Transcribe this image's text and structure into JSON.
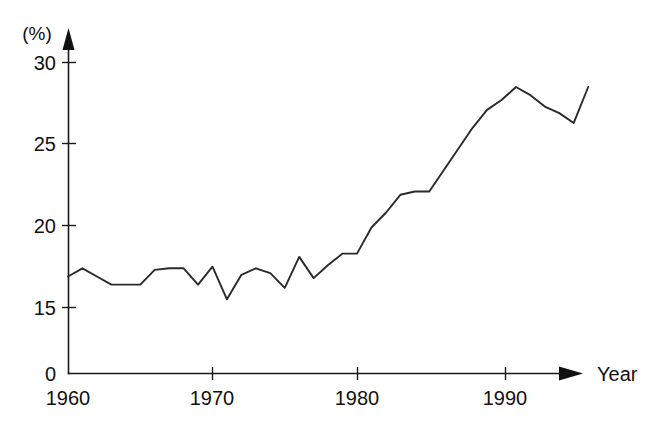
{
  "chart_data": {
    "type": "line",
    "title": "",
    "subtitle": "",
    "xlabel": "Year",
    "ylabel": "(%)",
    "unit_label": "(%)",
    "grid": false,
    "legend": null,
    "legend_position": "none",
    "axis_break": true,
    "axis_break_note": "Y axis jumps from 0 directly to 15",
    "xlim": [
      1959,
      1997
    ],
    "ylim": [
      0,
      31
    ],
    "y_ticks": [
      0,
      15,
      20,
      25,
      30
    ],
    "y_tick_labels": [
      "0",
      "15",
      "20",
      "25",
      "30"
    ],
    "x_ticks": [
      1960,
      1970,
      1980,
      1990
    ],
    "x_tick_labels": [
      "1960",
      "1970",
      "1980",
      "1990"
    ],
    "x": [
      1960,
      1961,
      1962,
      1963,
      1964,
      1965,
      1966,
      1967,
      1968,
      1969,
      1970,
      1971,
      1972,
      1973,
      1974,
      1975,
      1976,
      1977,
      1978,
      1979,
      1980,
      1981,
      1982,
      1983,
      1984,
      1985,
      1986,
      1987,
      1988,
      1989,
      1990,
      1991,
      1992,
      1993,
      1994,
      1995,
      1996
    ],
    "values": [
      16.9,
      17.4,
      16.9,
      16.4,
      16.4,
      16.4,
      17.3,
      17.4,
      17.4,
      16.4,
      17.5,
      15.5,
      17.0,
      17.4,
      17.1,
      16.2,
      18.1,
      16.8,
      17.6,
      18.3,
      18.3,
      19.9,
      20.8,
      21.9,
      22.1,
      22.1,
      23.4,
      24.7,
      26.0,
      27.1,
      27.7,
      28.5,
      28.0,
      27.3,
      26.9,
      26.3,
      28.5
    ],
    "series": [
      {
        "name": "percentage",
        "values": [
          16.9,
          17.4,
          16.9,
          16.4,
          16.4,
          16.4,
          17.3,
          17.4,
          17.4,
          16.4,
          17.5,
          15.5,
          17.0,
          17.4,
          17.1,
          16.2,
          18.1,
          16.8,
          17.6,
          18.3,
          18.3,
          19.9,
          20.8,
          21.9,
          22.1,
          22.1,
          23.4,
          24.7,
          26.0,
          27.1,
          27.7,
          28.5,
          28.0,
          27.3,
          26.9,
          26.3,
          28.5
        ],
        "color": "#2a2a2a"
      }
    ],
    "annotations": [],
    "colors": {
      "line": "#2a2a2a",
      "axis": "#1a1a1a",
      "text": "#111111",
      "background": "#ffffff"
    }
  },
  "axis": {
    "y_unit": "(%)",
    "x_title": "Year",
    "y_tick_0": "0",
    "y_tick_15": "15",
    "y_tick_20": "20",
    "y_tick_25": "25",
    "y_tick_30": "30",
    "x_tick_1960": "1960",
    "x_tick_1970": "1970",
    "x_tick_1980": "1980",
    "x_tick_1990": "1990"
  }
}
